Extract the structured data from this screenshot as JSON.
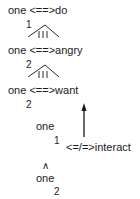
{
  "diagram": {
    "type": "conceptual-dependency",
    "nodes": [
      {
        "id": "row1",
        "actor": "one",
        "link": "<==>",
        "predicate": "do"
      },
      {
        "id": "link1",
        "label": "1"
      },
      {
        "id": "row2",
        "actor": "one",
        "link": "<==>",
        "predicate": "angry"
      },
      {
        "id": "link2",
        "label": "2"
      },
      {
        "id": "row3",
        "actor": "one",
        "link": "<==>",
        "predicate": "want"
      },
      {
        "id": "row3-index",
        "label": "2"
      },
      {
        "id": "row4",
        "actor": "one",
        "index": "1"
      },
      {
        "id": "row4-link",
        "link": "<=/=>",
        "predicate": "interact"
      },
      {
        "id": "row5-caret",
        "label": "^"
      },
      {
        "id": "row5",
        "actor": "one",
        "index": "2"
      }
    ]
  },
  "text": {
    "row1": "one <==>do",
    "cause1_label": "1",
    "row2": "one <==>angry",
    "cause2_label": "2",
    "row3": "one <==>want",
    "row3_index": "2",
    "row4_actor": "one",
    "row4_index": "1",
    "row4_link": "<=/=>interact",
    "row5_caret": "∧",
    "row5_actor": "one",
    "row5_index": "2"
  }
}
